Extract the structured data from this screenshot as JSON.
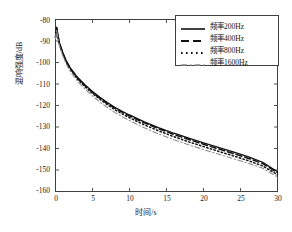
{
  "chart_data": {
    "type": "line",
    "title": "",
    "subtitle": "",
    "xlabel": "时间/s",
    "ylabel": "混响强度/dB",
    "xlim": [
      0,
      30
    ],
    "ylim": [
      -160,
      -80
    ],
    "xticks": [
      0,
      5,
      10,
      15,
      20,
      25,
      30
    ],
    "yticks": [
      -80,
      -90,
      -100,
      -110,
      -120,
      -130,
      -140,
      -150,
      -160
    ],
    "xtick_labels": [
      "0",
      "5",
      "10",
      "15",
      "20",
      "25",
      "30"
    ],
    "ytick_labels": [
      "-80",
      "-90",
      "-100",
      "-110",
      "-120",
      "-130",
      "-140",
      "-150",
      "-160"
    ],
    "grid": false,
    "legend_position": "upper right",
    "x": [
      0,
      0.15,
      0.5,
      1,
      1.5,
      2,
      3,
      4,
      5,
      6,
      7,
      8,
      9,
      10,
      12,
      14,
      16,
      18,
      20,
      22,
      24,
      26,
      28,
      30
    ],
    "series": [
      {
        "name": "频率200Hz",
        "label": "频率200Hz",
        "style": "solid",
        "color": "#111111",
        "values": [
          -88.0,
          -83.5,
          -90.5,
          -95.5,
          -99.5,
          -102.5,
          -107.0,
          -110.5,
          -113.5,
          -116.2,
          -118.6,
          -120.8,
          -122.7,
          -124.4,
          -127.6,
          -130.4,
          -132.9,
          -135.2,
          -137.4,
          -139.5,
          -141.6,
          -143.8,
          -146.4,
          -150.8
        ]
      },
      {
        "name": "频率400Hz",
        "label": "频率400Hz",
        "style": "dashed",
        "color": "#111111",
        "values": [
          -88.2,
          -83.8,
          -90.8,
          -95.8,
          -99.8,
          -102.8,
          -107.3,
          -110.8,
          -113.9,
          -116.6,
          -119.0,
          -121.2,
          -123.1,
          -124.9,
          -128.1,
          -130.9,
          -133.5,
          -135.8,
          -138.0,
          -140.2,
          -142.3,
          -144.5,
          -147.0,
          -151.3
        ]
      },
      {
        "name": "频率800Hz",
        "label": "频率800Hz",
        "style": "dotted",
        "color": "#111111",
        "values": [
          -88.5,
          -84.2,
          -91.2,
          -96.2,
          -100.2,
          -103.2,
          -107.8,
          -111.3,
          -114.4,
          -117.1,
          -119.6,
          -121.9,
          -123.9,
          -125.7,
          -129.0,
          -131.9,
          -134.5,
          -136.9,
          -139.1,
          -141.3,
          -143.4,
          -145.6,
          -148.1,
          -152.2
        ]
      },
      {
        "name": "频率1600Hz",
        "label": "频率1600Hz",
        "style": "dashdot",
        "color": "#8c8c8c",
        "values": [
          -89.0,
          -84.8,
          -92.0,
          -97.0,
          -101.0,
          -104.2,
          -108.8,
          -112.4,
          -115.6,
          -118.4,
          -120.9,
          -123.2,
          -125.2,
          -127.0,
          -130.4,
          -133.3,
          -135.9,
          -138.3,
          -140.5,
          -142.6,
          -144.7,
          -146.8,
          -149.2,
          -153.2
        ]
      }
    ]
  },
  "axes": {
    "x_title": "时间/s",
    "y_title": "混响强度/dB"
  },
  "legend": {
    "entries": [
      {
        "label": "频率200Hz",
        "style": "solid"
      },
      {
        "label": "频率400Hz",
        "style": "dashed"
      },
      {
        "label": "频率800Hz",
        "style": "dotted"
      },
      {
        "label": "频率1600Hz",
        "style": "dashdot"
      }
    ]
  },
  "colors": {
    "frame": "#404040",
    "series_dark": "#111111",
    "series_gray": "#8c8c8c",
    "background": "#ffffff"
  }
}
